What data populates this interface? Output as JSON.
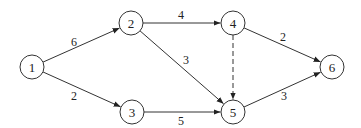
{
  "diagram": {
    "type": "directed-network",
    "nodes": [
      {
        "id": "1",
        "label": "1",
        "x": 32,
        "y": 67
      },
      {
        "id": "2",
        "label": "2",
        "x": 131,
        "y": 23
      },
      {
        "id": "3",
        "label": "3",
        "x": 132,
        "y": 112
      },
      {
        "id": "4",
        "label": "4",
        "x": 233,
        "y": 23
      },
      {
        "id": "5",
        "label": "5",
        "x": 233,
        "y": 112
      },
      {
        "id": "6",
        "label": "6",
        "x": 332,
        "y": 67
      }
    ],
    "edges": [
      {
        "from": "1",
        "to": "2",
        "label": "6",
        "dashed": false,
        "lx": 74,
        "ly": 42
      },
      {
        "from": "1",
        "to": "3",
        "label": "2",
        "dashed": false,
        "lx": 74,
        "ly": 96
      },
      {
        "from": "2",
        "to": "4",
        "label": "4",
        "dashed": false,
        "lx": 181,
        "ly": 15
      },
      {
        "from": "2",
        "to": "5",
        "label": "3",
        "dashed": false,
        "lx": 186,
        "ly": 60
      },
      {
        "from": "3",
        "to": "5",
        "label": "5",
        "dashed": false,
        "lx": 181,
        "ly": 121
      },
      {
        "from": "4",
        "to": "5",
        "label": "",
        "dashed": true,
        "lx": 0,
        "ly": 0
      },
      {
        "from": "4",
        "to": "6",
        "label": "2",
        "dashed": false,
        "lx": 283,
        "ly": 37
      },
      {
        "from": "5",
        "to": "6",
        "label": "3",
        "dashed": false,
        "lx": 284,
        "ly": 96
      }
    ],
    "node_radius": 12,
    "colors": {
      "stroke": "#333333",
      "text": "#222222",
      "background": "#ffffff"
    }
  }
}
